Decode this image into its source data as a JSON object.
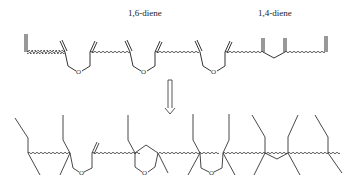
{
  "labels": {
    "diene16": "1,6-diene",
    "diene14": "1,4-diene"
  },
  "atoms": {
    "oxygen": "O"
  },
  "colors": {
    "line": "#333333",
    "background": "#ffffff"
  },
  "top_chain": {
    "description": "Polymer backbone with pendant 1,6-diene (ether-linked) and 1,4-diene units",
    "oxygen_bridges": 3,
    "methylene_bridges": 1
  },
  "arrow": {
    "direction": "down",
    "style": "hollow double-line"
  },
  "bottom_chain": {
    "description": "Crosslinked network after cyclization/crosslinking; contains one tetrahydropyran ring",
    "oxygen_bridges": 2,
    "ring_oxygens": 1,
    "methylene_bridges": 1
  }
}
